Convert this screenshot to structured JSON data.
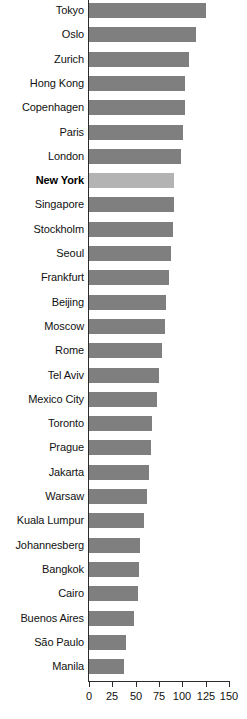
{
  "chart_data": {
    "type": "bar",
    "orientation": "horizontal",
    "title": "",
    "subtitle": "",
    "xlabel": "",
    "ylabel": "",
    "xlim": [
      0,
      150
    ],
    "xticks": [
      0,
      25,
      50,
      75,
      100,
      125,
      150
    ],
    "xtick_labels": [
      "0",
      "25",
      "50",
      "75",
      "100",
      "125",
      "150"
    ],
    "grid": false,
    "legend": null,
    "highlight_category": "New York",
    "colors": {
      "bar": "#7f7f7f",
      "highlight_bar": "#b3b3b3",
      "axis": "#2b2b2b",
      "text": "#111111",
      "background": "#ffffff"
    },
    "categories": [
      "Tokyo",
      "Oslo",
      "Zurich",
      "Hong Kong",
      "Copenhagen",
      "Paris",
      "London",
      "New York",
      "Singapore",
      "Stockholm",
      "Seoul",
      "Frankfurt",
      "Beijing",
      "Moscow",
      "Rome",
      "Tel Aviv",
      "Mexico City",
      "Toronto",
      "Prague",
      "Jakarta",
      "Warsaw",
      "Kuala Lumpur",
      "Johannesberg",
      "Bangkok",
      "Cairo",
      "Buenos Aires",
      "São Paulo",
      "Manila"
    ],
    "values": [
      125,
      115,
      107,
      103,
      103,
      101,
      99,
      91,
      91,
      90,
      88,
      86,
      83,
      81,
      78,
      75,
      73,
      68,
      66,
      64,
      62,
      59,
      55,
      54,
      52,
      48,
      40,
      37
    ]
  }
}
